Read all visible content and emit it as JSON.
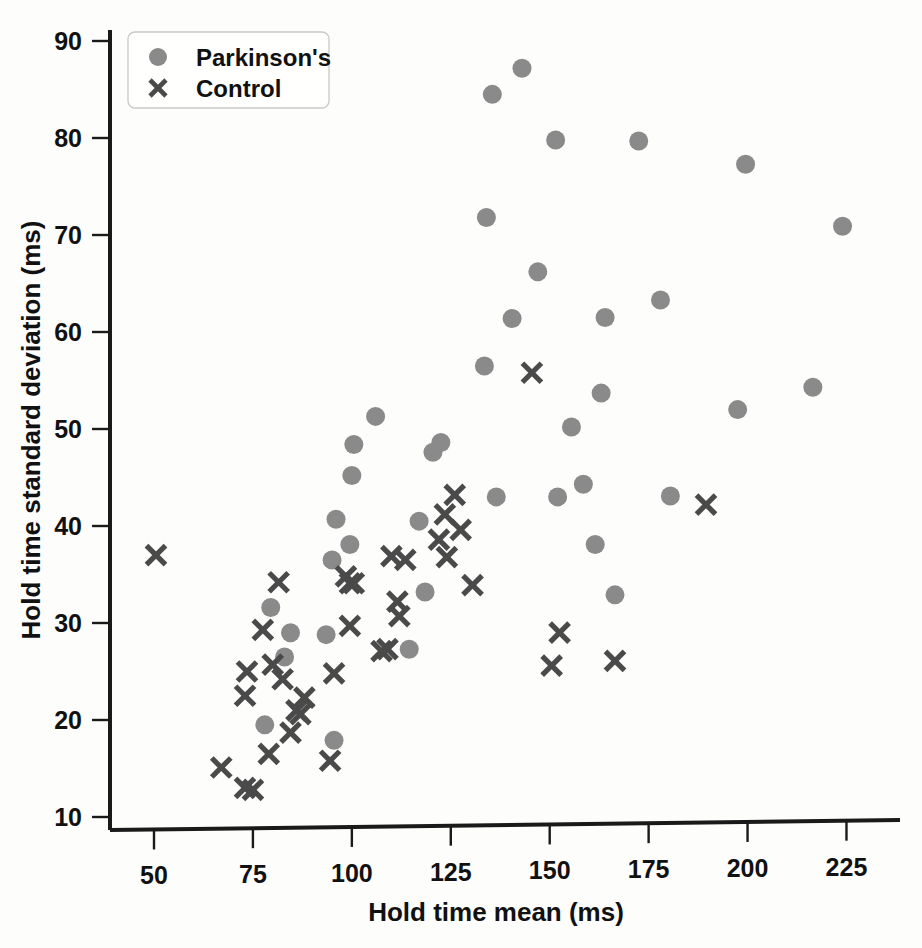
{
  "chart_data": {
    "type": "scatter",
    "title": "",
    "xlabel": "Hold time mean (ms)",
    "ylabel": "Hold time standard deviation (ms)",
    "xlim": [
      40,
      238
    ],
    "ylim": [
      8.5,
      91.5
    ],
    "xticks": [
      50,
      75,
      100,
      125,
      150,
      175,
      200,
      225
    ],
    "yticks": [
      10,
      20,
      30,
      40,
      50,
      60,
      70,
      80,
      90
    ],
    "grid": false,
    "legend_position": "upper-left",
    "series": [
      {
        "name": "Parkinson's",
        "marker": "circle",
        "color": "#8a8a8a",
        "points": [
          [
            143.0,
            87.2
          ],
          [
            135.5,
            84.5
          ],
          [
            151.5,
            79.8
          ],
          [
            172.5,
            79.7
          ],
          [
            199.5,
            77.3
          ],
          [
            224.0,
            70.9
          ],
          [
            134.0,
            71.8
          ],
          [
            147.0,
            66.2
          ],
          [
            178.0,
            63.3
          ],
          [
            140.5,
            61.4
          ],
          [
            164.0,
            61.5
          ],
          [
            133.5,
            56.5
          ],
          [
            163.0,
            53.7
          ],
          [
            216.5,
            54.3
          ],
          [
            197.5,
            52.0
          ],
          [
            155.5,
            50.2
          ],
          [
            106.0,
            51.3
          ],
          [
            100.5,
            48.4
          ],
          [
            122.5,
            48.6
          ],
          [
            120.5,
            47.6
          ],
          [
            100.0,
            45.2
          ],
          [
            136.5,
            43.0
          ],
          [
            152.0,
            43.0
          ],
          [
            180.5,
            43.1
          ],
          [
            158.5,
            44.3
          ],
          [
            96.0,
            40.7
          ],
          [
            117.0,
            40.5
          ],
          [
            99.5,
            38.1
          ],
          [
            161.5,
            38.1
          ],
          [
            95.0,
            36.5
          ],
          [
            118.5,
            33.2
          ],
          [
            166.5,
            32.9
          ],
          [
            79.5,
            31.6
          ],
          [
            84.5,
            29.0
          ],
          [
            93.5,
            28.8
          ],
          [
            83.0,
            26.5
          ],
          [
            114.5,
            27.3
          ],
          [
            78.0,
            19.5
          ],
          [
            95.5,
            17.9
          ]
        ]
      },
      {
        "name": "Control",
        "marker": "x",
        "color": "#4a4a4a",
        "points": [
          [
            145.5,
            55.8
          ],
          [
            126.0,
            43.2
          ],
          [
            189.5,
            42.2
          ],
          [
            123.5,
            41.2
          ],
          [
            127.5,
            39.6
          ],
          [
            122.0,
            38.6
          ],
          [
            110.0,
            36.9
          ],
          [
            113.5,
            36.5
          ],
          [
            124.0,
            36.8
          ],
          [
            130.5,
            33.9
          ],
          [
            98.5,
            34.8
          ],
          [
            99.5,
            34.1
          ],
          [
            100.5,
            34.1
          ],
          [
            81.5,
            34.2
          ],
          [
            111.5,
            32.2
          ],
          [
            112.0,
            30.7
          ],
          [
            77.5,
            29.3
          ],
          [
            152.5,
            29.0
          ],
          [
            99.5,
            29.7
          ],
          [
            107.5,
            27.1
          ],
          [
            109.0,
            27.3
          ],
          [
            166.5,
            26.1
          ],
          [
            150.5,
            25.6
          ],
          [
            73.5,
            25.0
          ],
          [
            80.0,
            25.7
          ],
          [
            50.5,
            37.0
          ],
          [
            82.5,
            24.2
          ],
          [
            95.5,
            24.8
          ],
          [
            73.0,
            22.5
          ],
          [
            88.0,
            22.3
          ],
          [
            86.0,
            21.0
          ],
          [
            87.0,
            20.6
          ],
          [
            84.5,
            18.7
          ],
          [
            79.0,
            16.5
          ],
          [
            94.5,
            15.8
          ],
          [
            67.0,
            15.1
          ],
          [
            73.0,
            13.0
          ],
          [
            75.0,
            12.8
          ]
        ]
      }
    ]
  },
  "legend": {
    "items": [
      {
        "label": "Parkinson's",
        "marker": "circle"
      },
      {
        "label": "Control",
        "marker": "x"
      }
    ]
  },
  "colors": {
    "parkinsons_marker": "#8a8a8a",
    "control_marker": "#4a4a4a",
    "axis": "#1a1a1a",
    "text": "#111111",
    "background": "#fdfdfc"
  }
}
